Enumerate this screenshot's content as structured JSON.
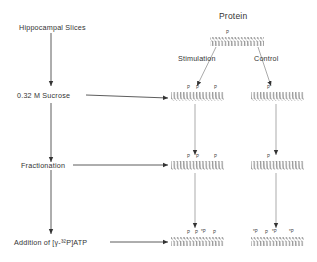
{
  "diagram": {
    "steps": [
      {
        "label": "Hippocampal Slices"
      },
      {
        "label": "0.32 M Sucrose"
      },
      {
        "label": "Fractionation"
      },
      {
        "label": "Addition of [γ-³²P]ATP"
      }
    ],
    "protein_header": "Protein",
    "branches": {
      "left": "Stimulation",
      "right": "Control"
    },
    "phospho_marks": {
      "initial": [
        "P"
      ],
      "stim_sucrose": [
        "P",
        "P",
        "P"
      ],
      "ctrl_sucrose": [
        "P"
      ],
      "stim_fraction": [
        "P",
        "P",
        "P"
      ],
      "ctrl_fraction": [
        "P"
      ],
      "stim_atp": [
        "P",
        "P",
        "*P",
        "P"
      ],
      "ctrl_atp": [
        "*P",
        "P",
        "*P",
        "*P"
      ]
    },
    "colors": {
      "line": "#333333",
      "coil": "#555555",
      "text": "#333333"
    }
  }
}
